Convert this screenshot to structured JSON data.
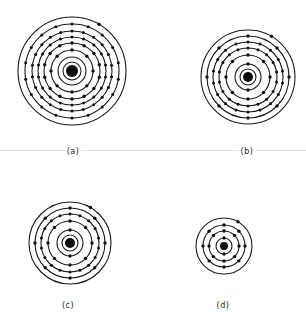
{
  "figure": {
    "colors": {
      "line": "#1a1a1a",
      "electron": "#111111",
      "nucleus": "#0d0d0d",
      "rule": "#e4e4e4"
    },
    "atoms": [
      {
        "id": "a",
        "label": "(a)",
        "center": [
          72,
          71
        ],
        "nucleus_radius": 6,
        "shells": [
          {
            "r": 9,
            "electrons": 0
          },
          {
            "r": 14,
            "electrons": 0
          },
          {
            "r": 21,
            "electrons": 8
          },
          {
            "r": 28,
            "electrons": 14
          },
          {
            "r": 34,
            "electrons": 18
          },
          {
            "r": 40,
            "electrons": 22
          },
          {
            "r": 47,
            "electrons": 18
          },
          {
            "r": 54,
            "electrons": 1
          }
        ],
        "label_pos": [
          73,
          147
        ]
      },
      {
        "id": "b",
        "label": "(b)",
        "center": [
          248,
          77
        ],
        "nucleus_radius": 5,
        "shells": [
          {
            "r": 8,
            "electrons": 0
          },
          {
            "r": 13,
            "electrons": 2
          },
          {
            "r": 22,
            "electrons": 8
          },
          {
            "r": 29,
            "electrons": 18
          },
          {
            "r": 35,
            "electrons": 18
          },
          {
            "r": 41,
            "electrons": 8
          },
          {
            "r": 47,
            "electrons": 1
          }
        ],
        "label_pos": [
          247,
          147
        ]
      },
      {
        "id": "c",
        "label": "(c)",
        "center": [
          70,
          243
        ],
        "nucleus_radius": 5,
        "shells": [
          {
            "r": 8,
            "electrons": 0
          },
          {
            "r": 13,
            "electrons": 2
          },
          {
            "r": 22,
            "electrons": 8
          },
          {
            "r": 29,
            "electrons": 18
          },
          {
            "r": 35,
            "electrons": 8
          },
          {
            "r": 41,
            "electrons": 1
          }
        ],
        "label_pos": [
          68,
          301
        ]
      },
      {
        "id": "d",
        "label": "(d)",
        "center": [
          224,
          246
        ],
        "nucleus_radius": 4,
        "shells": [
          {
            "r": 8,
            "electrons": 2
          },
          {
            "r": 15,
            "electrons": 8
          },
          {
            "r": 21,
            "electrons": 8
          },
          {
            "r": 28,
            "electrons": 1
          }
        ],
        "label_pos": [
          223,
          301
        ]
      }
    ]
  }
}
